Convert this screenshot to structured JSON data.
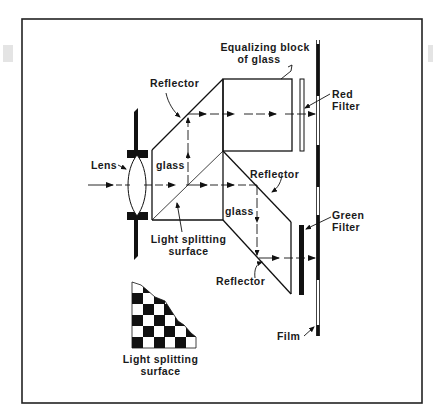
{
  "diagram": {
    "type": "optical schematic",
    "colors": {
      "ink": "#111111",
      "background": "#ffffff",
      "frame": "#222222"
    },
    "labels": {
      "equalizing_block_line1": "Equalizing block",
      "equalizing_block_line2": "of glass",
      "reflector_top": "Reflector",
      "red_filter_line1": "Red",
      "red_filter_line2": "Filter",
      "lens": "Lens",
      "glass_upper": "glass",
      "reflector_mid": "Reflector",
      "glass_lower": "glass",
      "light_splitting_line1": "Light splitting",
      "light_splitting_line2": "surface",
      "green_filter_line1": "Green",
      "green_filter_line2": "Filter",
      "reflector_bottom": "Reflector",
      "film": "Film",
      "inset_caption_line1": "Light splitting",
      "inset_caption_line2": "surface"
    },
    "components": [
      {
        "name": "Lens",
        "role": "collects incoming light"
      },
      {
        "name": "Light splitting surface",
        "role": "divides beam into two paths"
      },
      {
        "name": "Reflector (upper)",
        "role": "redirects upper beam toward red filter"
      },
      {
        "name": "Equalizing block of glass",
        "role": "equalizes optical path length"
      },
      {
        "name": "Reflector (middle)",
        "role": "redirects beam downward"
      },
      {
        "name": "Reflector (lower)",
        "role": "redirects beam toward green filter"
      },
      {
        "name": "Red Filter",
        "role": "filters upper beam"
      },
      {
        "name": "Green Filter",
        "role": "filters lower beam"
      },
      {
        "name": "Film",
        "role": "records both images"
      }
    ],
    "inset": {
      "description": "checkerboard pattern of the light splitting surface",
      "grid": "6x6 partial checkerboard"
    }
  }
}
